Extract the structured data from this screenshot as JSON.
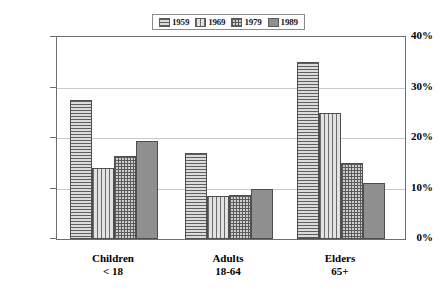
{
  "chart_data": {
    "type": "bar",
    "title": "",
    "subtitle": "",
    "xlabel": "",
    "ylabel": "",
    "ylim": [
      0,
      40
    ],
    "y_tick_labels": [
      "0%",
      "10%",
      "20%",
      "30%",
      "40%"
    ],
    "y_ticks": [
      0,
      10,
      20,
      30,
      40
    ],
    "grid": true,
    "legend_position": "top-center",
    "categories": [
      "Children",
      "Adults",
      "Elders"
    ],
    "category_sublabels": [
      "< 18",
      "18-64",
      "65+"
    ],
    "series": [
      {
        "name": "1959",
        "pattern": "horizontal-lines",
        "values": [
          27.5,
          17.0,
          35.0
        ]
      },
      {
        "name": "1969",
        "pattern": "vertical-lines",
        "values": [
          14.0,
          8.5,
          25.0
        ]
      },
      {
        "name": "1979",
        "pattern": "crosshatch-grid",
        "values": [
          16.5,
          8.8,
          15.0
        ]
      },
      {
        "name": "1989",
        "pattern": "solid-gray",
        "values": [
          19.5,
          10.0,
          11.0
        ]
      }
    ],
    "colors": {
      "series_1959": "#c9c9c9",
      "series_1969": "#d2d2d2",
      "series_1979": "#cfcfcf",
      "series_1989": "#8f8f8f",
      "gridline": "#c8c8c8",
      "axis": "#6e6e6e",
      "background": "#ffffff",
      "text": "#000000"
    }
  }
}
